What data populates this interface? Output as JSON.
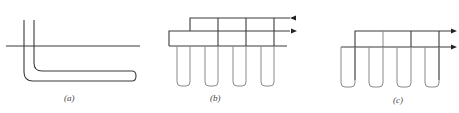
{
  "figure": {
    "panels": [
      {
        "id": "a",
        "label": "(a)"
      },
      {
        "id": "b",
        "label": "(b)"
      },
      {
        "id": "c",
        "label": "(c)"
      }
    ],
    "colors": {
      "line": "#3a3a3a",
      "light_line": "#8a8a8a",
      "background": "#ffffff"
    }
  }
}
